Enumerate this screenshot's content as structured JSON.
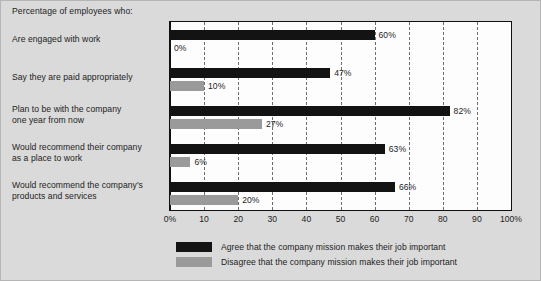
{
  "chart_data": {
    "type": "bar",
    "orientation": "horizontal",
    "title": "Percentage of employees who:",
    "xlabel": "",
    "ylabel": "",
    "xlim": [
      0,
      100
    ],
    "grid": true,
    "legend_position": "bottom",
    "categories": [
      "Are engaged with work",
      "Say they are paid appropriately",
      "Plan to be with the company one year from now",
      "Would recommend their company as a place to work",
      "Would recommend the company's products and services"
    ],
    "category_lines": [
      [
        "Are engaged with work"
      ],
      [
        "Say they are paid appropriately"
      ],
      [
        "Plan to be with the company",
        "one year from now"
      ],
      [
        "Would recommend their company",
        "as a place to work"
      ],
      [
        "Would recommend the company's",
        "products and services"
      ]
    ],
    "series": [
      {
        "name": "Agree that the company mission makes their job important",
        "color": "#131313",
        "values": [
          60,
          47,
          82,
          63,
          66
        ],
        "labels": [
          "60%",
          "47%",
          "82%",
          "63%",
          "66%"
        ]
      },
      {
        "name": "Disagree that the company mission makes their job important",
        "color": "#9a9a9a",
        "values": [
          0,
          10,
          27,
          6,
          20
        ],
        "labels": [
          "0%",
          "10%",
          "27%",
          "6%",
          "20%"
        ]
      }
    ],
    "xticks": [
      0,
      10,
      20,
      30,
      40,
      50,
      60,
      70,
      80,
      90,
      100
    ],
    "xtick_labels": [
      "0%",
      "10",
      "20",
      "30",
      "40",
      "50",
      "60",
      "70",
      "80",
      "90",
      "100%"
    ]
  },
  "legend": {
    "items": [
      {
        "label": "Agree that the company mission makes their job important",
        "color": "#131313"
      },
      {
        "label": "Disagree that the company mission makes their job important",
        "color": "#9a9a9a"
      }
    ]
  },
  "colors": {
    "background": "#dadada",
    "plot_background": "#fdfdfd",
    "frame": "#101010",
    "gridline": "#6e6e6e",
    "text": "#1d1d1d",
    "agree": "#131313",
    "disagree": "#9a9a9a"
  }
}
